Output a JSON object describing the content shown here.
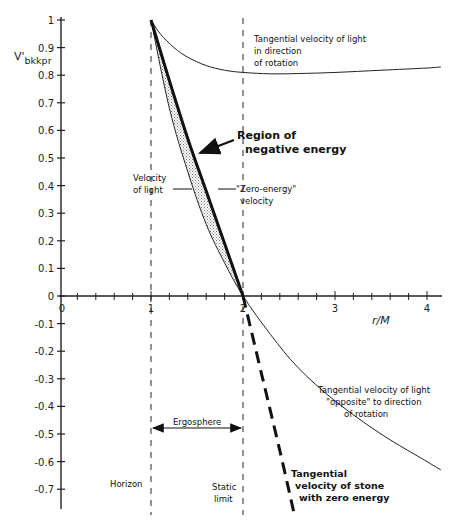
{
  "chart_data": {
    "type": "line",
    "title": "",
    "xlabel": "r/M",
    "ylabel": "V'bkkpr",
    "xlim": [
      0,
      4.15
    ],
    "ylim": [
      -0.78,
      1.0
    ],
    "grid": false,
    "x_ticks": [
      "0",
      "1",
      "2",
      "3",
      "4"
    ],
    "y_ticks": [
      "1",
      "0.9",
      "0.8",
      "0.7",
      "0.6",
      "0.5",
      "0.4",
      "0.3",
      "0.2",
      "0.1",
      "0",
      "-0.1",
      "-0.2",
      "-0.3",
      "-0.4",
      "-0.5",
      "-0.6",
      "-0.7"
    ],
    "series": [
      {
        "name": "Tangential velocity of light in direction of rotation",
        "style": "solid-thin",
        "x": [
          1.0,
          1.1,
          1.25,
          1.4,
          1.6,
          1.8,
          2.0,
          2.3,
          2.6,
          3.0,
          3.5,
          4.0,
          4.15
        ],
        "y": [
          1.0,
          0.95,
          0.9,
          0.865,
          0.835,
          0.818,
          0.81,
          0.805,
          0.806,
          0.81,
          0.818,
          0.826,
          0.83
        ]
      },
      {
        "name": "Velocity of light (opposite to direction of rotation)",
        "style": "solid-thin",
        "x": [
          1.0,
          1.2,
          1.4,
          1.6,
          1.8,
          2.0,
          2.3,
          2.6,
          3.0,
          3.5,
          4.0,
          4.15
        ],
        "y": [
          1.0,
          0.68,
          0.45,
          0.26,
          0.12,
          0.0,
          -0.14,
          -0.26,
          -0.38,
          -0.5,
          -0.6,
          -0.63
        ]
      },
      {
        "name": "Zero-energy velocity (tangential velocity of stone with zero energy)",
        "style": "thick / dashed below axis",
        "x": [
          1.0,
          1.2,
          1.4,
          1.6,
          1.8,
          2.0,
          2.2,
          2.4,
          2.55
        ],
        "y": [
          1.0,
          0.78,
          0.57,
          0.38,
          0.19,
          0.0,
          -0.28,
          -0.56,
          -0.78
        ]
      }
    ],
    "vertical_lines": [
      {
        "x": 1,
        "label": "Horizon",
        "style": "dashed"
      },
      {
        "x": 2,
        "label": "Static limit",
        "style": "dashed"
      }
    ],
    "shaded_region": {
      "label": "Region of negative energy",
      "between": [
        "Velocity of light",
        "Zero-energy velocity"
      ],
      "x_range": [
        1,
        2
      ],
      "pattern": "stippled"
    },
    "annotations": [
      "Tangential velocity of light in direction of rotation",
      "Region of negative energy",
      "Velocity of light",
      "\"Zero-energy\" velocity",
      "Tangential velocity of light \"opposite\" to direction of rotation",
      "Ergosphere",
      "Horizon",
      "Static limit",
      "Tangential velocity of stone with zero energy"
    ]
  },
  "axes": {
    "ylabel_main": "V'",
    "ylabel_sub": "bkkpr",
    "xlabel": "r/M"
  },
  "labels": {
    "light_corot": [
      "Tangential velocity of light",
      "in direction",
      "of rotation"
    ],
    "neg_region": [
      "Region of",
      "negative energy"
    ],
    "vel_light": [
      "Velocity",
      "of light"
    ],
    "zero_energy": [
      "\"Zero-energy\"",
      "velocity"
    ],
    "light_opp": [
      "Tangential velocity of light",
      "\"opposite\" to direction",
      "of rotation"
    ],
    "ergosphere": "Ergosphere",
    "horizon": "Horizon",
    "static_limit": [
      "Static",
      "limit"
    ],
    "stone": [
      "Tangential",
      "velocity of stone",
      "with zero energy"
    ]
  },
  "colors": {
    "ink": "#111111",
    "axis": "#222222",
    "stipple": "#9a9a9a"
  }
}
